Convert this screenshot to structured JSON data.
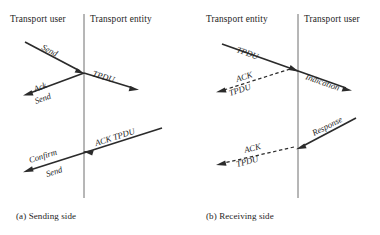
{
  "figure": {
    "panels": [
      {
        "id": "sending-side",
        "caption": "(a)  Sending side",
        "left_header": "Transport user",
        "right_header": "Transport entity",
        "labels": {
          "send_request": "Send",
          "ack": "Ack",
          "send_ack": "Send",
          "tpdu": "TPDU",
          "ack_tpdu": "ACK TPDU",
          "confirm": "Confirm",
          "send_confirm": "Send"
        }
      },
      {
        "id": "receiving-side",
        "caption": "(b)  Receiving side",
        "left_header": "Transport entity",
        "right_header": "Transport user",
        "labels": {
          "tpdu_in": "TPDU",
          "indication": "Indication",
          "ack_upper": "ACK",
          "tpdu_upper": "TPDU",
          "response": "Response",
          "ack_lower": "ACK",
          "tpdu_lower": "TPDU"
        }
      }
    ],
    "colors": {
      "ink": "#1d1d1d",
      "arrow": "#2b2b2b",
      "lifeline": "#6f6f6f",
      "background": "#ffffff"
    }
  }
}
